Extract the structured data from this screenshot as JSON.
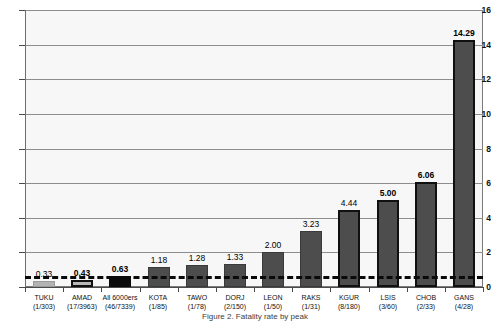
{
  "chart_data": {
    "type": "bar",
    "title": "",
    "subtitle": "",
    "xlabel": "",
    "ylabel": "",
    "ylim": [
      0,
      16
    ],
    "ytick_step": 2,
    "yticks": [
      0,
      2,
      4,
      6,
      8,
      10,
      12,
      14,
      16
    ],
    "ytick_labels": [
      "0",
      "2",
      "4",
      "6",
      "8",
      "10",
      "12",
      "14",
      "16"
    ],
    "grid": true,
    "grid_axis": "y",
    "legend": false,
    "categories": [
      "TUKU",
      "AMAD",
      "All 6000ers",
      "KOTA",
      "TAWO",
      "DORJ",
      "LEON",
      "RAKS",
      "KGUR",
      "LSIS",
      "CHOB",
      "GANS"
    ],
    "category_sublabels": [
      "(1/303)",
      "(17/3963)",
      "(46/7339)",
      "(1/85)",
      "(1/78)",
      "(2/150)",
      "(1/50)",
      "(1/31)",
      "(8/180)",
      "(3/60)",
      "(2/33)",
      "(4/28)"
    ],
    "values": [
      0.33,
      0.43,
      0.63,
      1.18,
      1.28,
      1.33,
      2.0,
      3.23,
      4.44,
      5.0,
      6.06,
      14.29
    ],
    "value_labels": [
      "0.33",
      "0.43",
      "0.63",
      "1.18",
      "1.28",
      "1.33",
      "2.00",
      "3.23",
      "4.44",
      "5.00",
      "6.06",
      "14.29"
    ],
    "value_label_bold": [
      false,
      true,
      true,
      false,
      false,
      false,
      false,
      false,
      false,
      true,
      true,
      true
    ],
    "bar_styles": [
      "style-light",
      "style-outlined",
      "style-solid",
      "style-dark",
      "style-dark",
      "style-dark",
      "style-dark",
      "style-dark",
      "style-dark-outlined",
      "style-dark-outlined",
      "style-dark-outlined",
      "style-dark-outlined"
    ],
    "reference_line": {
      "value": 0.63,
      "style": "dashed",
      "label": ""
    },
    "colors": {
      "plot_background": "#f7f7f7",
      "gridline": "#8d8d8d",
      "axis": "#4a4a4a",
      "bar_light": "#b3b3b3",
      "bar_outlined_fill": "#b9b9b9",
      "bar_solid": "#0b0b0b",
      "bar_dark": "#4d4d4d",
      "bar_border": "#101010",
      "reference_line": "#0a0a0a",
      "text": "#111111"
    }
  },
  "caption": {
    "text": "Figure 2. Fatality rate by peak"
  }
}
